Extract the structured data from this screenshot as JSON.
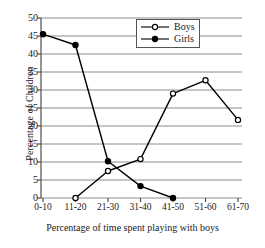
{
  "chart_data": {
    "type": "line",
    "title": "",
    "xlabel": "Percentage of time spent playing with boys",
    "ylabel": "Percentage of Children",
    "categories": [
      "0-10",
      "11-20",
      "21-30",
      "31-40",
      "41-50",
      "51-60",
      "61-70"
    ],
    "ylim": [
      0,
      50
    ],
    "yticks": [
      0,
      5,
      10,
      15,
      20,
      25,
      30,
      35,
      40,
      45,
      50
    ],
    "grid": true,
    "legend_position": "top-right",
    "series": [
      {
        "name": "Boys",
        "marker": "open-circle",
        "color": "#000000",
        "values": [
          null,
          0,
          7.5,
          10.8,
          29,
          32.7,
          21.7
        ]
      },
      {
        "name": "Girls",
        "marker": "filled-circle",
        "color": "#000000",
        "values": [
          45.5,
          42.5,
          10.2,
          3.3,
          0,
          null,
          null
        ]
      }
    ]
  },
  "axes": {
    "y_title": "Percentage of Children",
    "x_title": "Percentage of time spent playing with boys",
    "y_tick_labels": [
      "50",
      "45",
      "40",
      "35",
      "30",
      "25",
      "20",
      "15",
      "10",
      "5",
      "0"
    ],
    "x_tick_labels": [
      "0-10",
      "11-20",
      "21-30",
      "31-40",
      "41-50",
      "51-60",
      "61-70"
    ]
  },
  "legend": {
    "items": [
      {
        "label": "Boys",
        "marker": "open-circle"
      },
      {
        "label": "Girls",
        "marker": "filled-circle"
      }
    ]
  },
  "colors": {
    "line": "#000000",
    "grid": "#8c8c8c",
    "axis": "#4d4d4d",
    "background": "#ffffff"
  }
}
